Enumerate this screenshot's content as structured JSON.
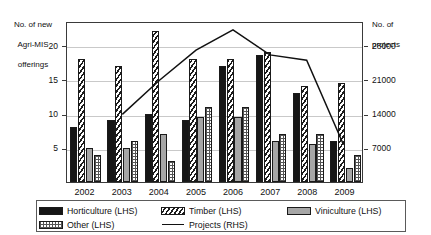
{
  "chart_data": {
    "type": "bar",
    "title": "",
    "subtitle": "",
    "xlabel": "",
    "ylabel": "No. of new Agri-MIS offerings",
    "y2label": "No. of projects",
    "categories": [
      "2002",
      "2003",
      "2004",
      "2005",
      "2006",
      "2007",
      "2008",
      "2009"
    ],
    "ylim": [
      0,
      23.5
    ],
    "yticks": [
      5,
      10,
      15,
      20
    ],
    "ytick_labels": [
      "5",
      "10",
      "15",
      "20"
    ],
    "y2lim": [
      0,
      32900
    ],
    "y2ticks": [
      7000,
      14000,
      21000,
      28000
    ],
    "y2tick_labels": [
      "7000",
      "14000",
      "21000",
      "28000"
    ],
    "grid": true,
    "legend_position": "below",
    "series": [
      {
        "name": "Horticulture (LHS)",
        "axis": "left",
        "kind": "bar",
        "swatch": "solid-black",
        "values": [
          8,
          9,
          10,
          9,
          17,
          18.5,
          13,
          6
        ]
      },
      {
        "name": "Timber (LHS)",
        "axis": "left",
        "kind": "bar",
        "swatch": "diagonal-hatch",
        "values": [
          18,
          17,
          22,
          18,
          18,
          19,
          14,
          14.5
        ]
      },
      {
        "name": "Viniculture (LHS)",
        "axis": "left",
        "kind": "bar",
        "swatch": "solid-grey",
        "values": [
          5,
          5,
          7,
          9.5,
          9.5,
          6,
          5.5,
          2
        ]
      },
      {
        "name": "Other (LHS)",
        "axis": "left",
        "kind": "bar",
        "swatch": "cross-dots",
        "values": [
          4,
          6,
          3,
          11,
          11,
          7,
          7,
          4
        ]
      },
      {
        "name": "Projects (RHS)",
        "axis": "right",
        "kind": "line",
        "swatch": "line",
        "values": [
          null,
          14000,
          21000,
          27300,
          31500,
          26300,
          25200,
          7700
        ]
      }
    ]
  },
  "axes": {
    "left_title_line1": "No. of new",
    "left_title_line2": "Agri-MIS",
    "left_title_line3": "offerings",
    "right_title_line1": "No. of",
    "right_title_line2": "projects"
  },
  "legend": {
    "items": [
      {
        "label": "Horticulture (LHS)",
        "swatch": "solid-black"
      },
      {
        "label": "Timber (LHS)",
        "swatch": "diagonal-hatch"
      },
      {
        "label": "Viniculture (LHS)",
        "swatch": "solid-grey"
      },
      {
        "label": "Other (LHS)",
        "swatch": "cross-dots"
      },
      {
        "label": "Projects (RHS)",
        "swatch": "line"
      }
    ]
  },
  "colors": {
    "horticulture": "#161616",
    "timber": "#1d1d1d",
    "viniculture": "#a6a6a6",
    "other": "#555555",
    "projects_line": "#111111",
    "gridline": "#c9c9c9",
    "axis": "#3a3a3a",
    "background": "#ffffff"
  }
}
